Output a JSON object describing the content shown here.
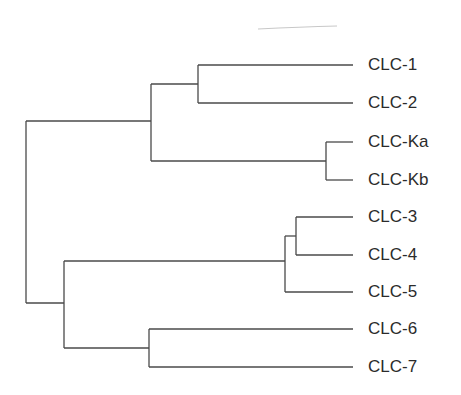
{
  "diagram": {
    "type": "dendrogram",
    "orientation": "left-to-right",
    "line_color": "#4a4a4a",
    "leaves": [
      {
        "label": "CLC-1",
        "y": 65
      },
      {
        "label": "CLC-2",
        "y": 103
      },
      {
        "label": "CLC-Ka",
        "y": 142
      },
      {
        "label": "CLC-Kb",
        "y": 180
      },
      {
        "label": "CLC-3",
        "y": 217
      },
      {
        "label": "CLC-4",
        "y": 255
      },
      {
        "label": "CLC-5",
        "y": 292
      },
      {
        "label": "CLC-6",
        "y": 329
      },
      {
        "label": "CLC-7",
        "y": 367
      }
    ],
    "clades": [
      {
        "name": "CLC-1/CLC-2",
        "members": [
          "CLC-1",
          "CLC-2"
        ]
      },
      {
        "name": "CLC-Ka/CLC-Kb",
        "members": [
          "CLC-Ka",
          "CLC-Kb"
        ]
      },
      {
        "name": "CLC-3/CLC-4",
        "members": [
          "CLC-3",
          "CLC-4"
        ]
      },
      {
        "name": "CLC-3/4/5",
        "members": [
          "CLC-3",
          "CLC-4",
          "CLC-5"
        ]
      },
      {
        "name": "CLC-6/CLC-7",
        "members": [
          "CLC-6",
          "CLC-7"
        ]
      }
    ]
  }
}
